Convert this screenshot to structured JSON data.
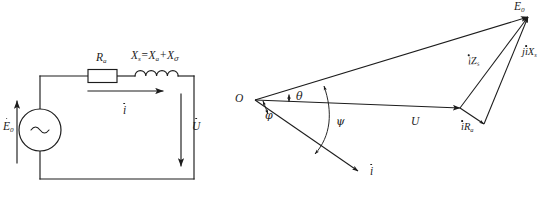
{
  "figure": {
    "ink_color": "#1c1c1c",
    "background_color": "#ffffff"
  },
  "circuit": {
    "name": "equivalent-circuit",
    "source": {
      "label_base": "E",
      "label_sub": "0",
      "symbol": "~",
      "has_overdot": true
    },
    "resistor": {
      "label_base": "R",
      "label_sub": "a"
    },
    "reactance": {
      "label_full": "X",
      "label_sub_1": "s",
      "equals": "=",
      "label_2": "X",
      "label_sub_2": "a",
      "plus": "+",
      "label_3": "X",
      "label_sub_3": "σ"
    },
    "current": {
      "label_base": "i",
      "has_overdot": true
    },
    "terminal_voltage": {
      "label_base": "U",
      "has_overdot": true
    }
  },
  "phasor": {
    "name": "phasor-diagram",
    "origin_label": "O",
    "vectors": [
      {
        "id": "emf",
        "label_base": "E",
        "label_sub": "0",
        "has_overdot": true
      },
      {
        "id": "voltage",
        "label_base": "U",
        "label_sub": "",
        "has_overdot": false
      },
      {
        "id": "current",
        "label_base": "i",
        "label_sub": "",
        "has_overdot": true
      },
      {
        "id": "iz",
        "label_base": "Z",
        "label_sub": "s",
        "prefix": "i",
        "has_overdot": true
      },
      {
        "id": "ir",
        "label_base": "R",
        "label_sub": "a",
        "prefix": "i",
        "has_overdot": true
      },
      {
        "id": "jix",
        "label_base": "X",
        "label_sub": "s",
        "prefix": "ji",
        "has_overdot": true
      }
    ],
    "angles": [
      {
        "id": "theta",
        "symbol": "θ"
      },
      {
        "id": "phi",
        "symbol": "φ"
      },
      {
        "id": "psi",
        "symbol": "ψ"
      }
    ]
  }
}
